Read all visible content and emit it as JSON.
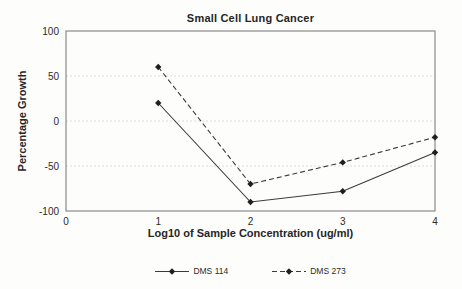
{
  "figure": {
    "background": "#fdfdfc",
    "border_color": "#8a8a8a",
    "gridline_color": "#dcdcd8",
    "line_color": "#3a3a3a",
    "marker_color": "#1f1f1f",
    "text_color": "#2b2b2b"
  },
  "chart_data": {
    "type": "line",
    "title": "Small Cell Lung Cancer",
    "xlabel": "Log10 of Sample Concentration (ug/ml)",
    "ylabel": "Percentage Growth",
    "x": [
      1,
      2,
      3,
      4
    ],
    "series": [
      {
        "name": "DMS 114",
        "style": "solid",
        "marker": "diamond",
        "values": [
          20,
          -90,
          -78,
          -35
        ]
      },
      {
        "name": "DMS 273",
        "style": "dashed",
        "marker": "diamond",
        "values": [
          60,
          -70,
          -46,
          -18
        ]
      }
    ],
    "xlim": [
      0,
      4
    ],
    "ylim": [
      -100,
      100
    ],
    "x_ticks": [
      0,
      1,
      2,
      3,
      4
    ],
    "y_ticks": [
      100,
      50,
      0,
      -50,
      -100
    ],
    "gridlines_y": [
      50,
      0,
      -50
    ],
    "grid": "horizontal-dashed-light",
    "legend_position": "bottom-center"
  }
}
